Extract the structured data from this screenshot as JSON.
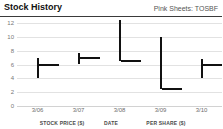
{
  "header": {
    "title": "Stock History",
    "exchange_label": "Pink Sheets: TOSBF"
  },
  "footer": {
    "items": [
      {
        "label": "STOCK PRICE ($)",
        "x": 62
      },
      {
        "label": "DATE",
        "x": 111
      },
      {
        "label": "PER SHARE ($)",
        "x": 166
      }
    ]
  },
  "colors": {
    "bar": "#111111",
    "grid": "#e2e2e2",
    "axis_text": "#6d6d6d",
    "header_rule": "#3a3a3a",
    "background": "#ffffff"
  },
  "chart_data": {
    "type": "ohlc",
    "title": "Stock History",
    "subtitle": "Pink Sheets: TOSBF",
    "xlabel": "",
    "ylabel": "",
    "ylim": [
      0,
      12
    ],
    "yticks": [
      0,
      2,
      4,
      6,
      8,
      10,
      12
    ],
    "grid": true,
    "legend": false,
    "categories": [
      "3/06",
      "3/07",
      "3/08",
      "3/09",
      "3/10"
    ],
    "series": [
      {
        "name": "Price range",
        "points": [
          {
            "date": "3/06",
            "high": 7.0,
            "low": 4.0,
            "close": 6.0
          },
          {
            "date": "3/07",
            "high": 7.6,
            "low": 6.0,
            "close": 7.0
          },
          {
            "date": "3/08",
            "high": 12.4,
            "low": 6.5,
            "close": 6.5
          },
          {
            "date": "3/09",
            "high": 10.0,
            "low": 2.5,
            "close": 2.5
          },
          {
            "date": "3/10",
            "high": 6.8,
            "low": 4.0,
            "close": 6.0
          }
        ]
      }
    ]
  }
}
